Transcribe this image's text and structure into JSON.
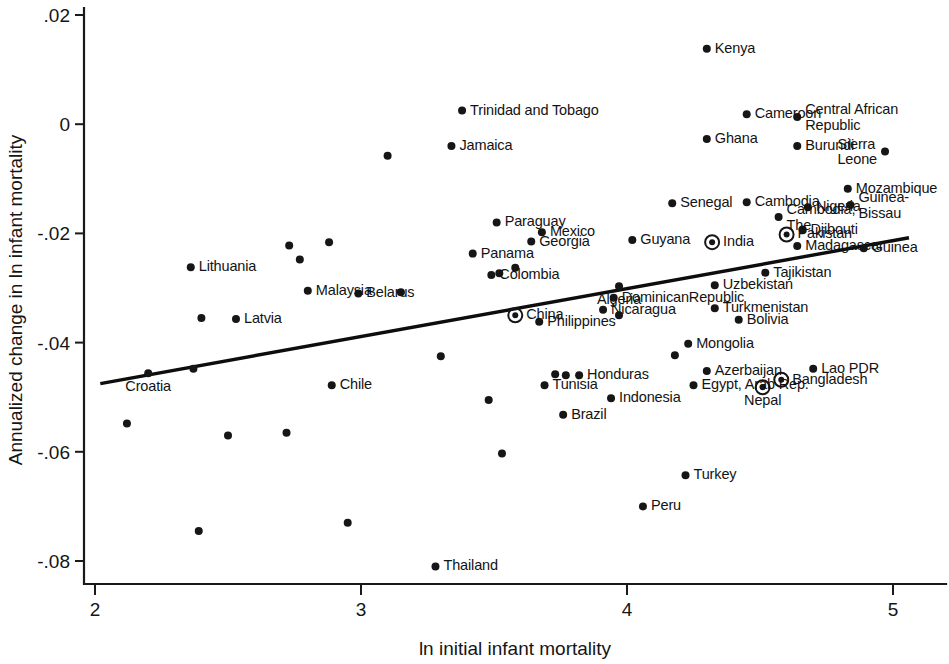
{
  "chart_data": {
    "type": "scatter",
    "title": "",
    "xlabel": "ln initial infant mortality",
    "ylabel": "Annualized change in ln infant mortality",
    "xlim": [
      1.95,
      5.1
    ],
    "ylim": [
      -0.0855,
      0.0225
    ],
    "grid": false,
    "legend": null,
    "xticks": [
      "2",
      "3",
      "4",
      "5"
    ],
    "xtickvals": [
      2,
      3,
      4,
      5
    ],
    "yticks": [
      ".02",
      "0",
      "-.02",
      "-.04",
      "-.06",
      "-.08"
    ],
    "ytickvals": [
      0.02,
      0,
      -0.02,
      -0.04,
      -0.06,
      -0.08
    ],
    "fit_line": {
      "x": [
        2.02,
        5.06
      ],
      "y": [
        -0.0475,
        -0.0208
      ]
    },
    "points": [
      {
        "label": "Kenya",
        "x": 4.3,
        "y": 0.0138,
        "side": "l",
        "highlight": false
      },
      {
        "label": "Trinidad and Tobago",
        "x": 3.38,
        "y": 0.0025,
        "side": "l",
        "highlight": false
      },
      {
        "label": "Cameroon",
        "x": 4.45,
        "y": 0.0018,
        "side": "l",
        "highlight": false
      },
      {
        "label": "Central African\nRepublic",
        "x": 4.64,
        "y": 0.0013,
        "side": "l",
        "highlight": false
      },
      {
        "label": "Ghana",
        "x": 4.3,
        "y": -0.0027,
        "side": "l",
        "highlight": false
      },
      {
        "label": "Burundi",
        "x": 4.64,
        "y": -0.004,
        "side": "l",
        "highlight": false
      },
      {
        "label": "Sierra\nLeone",
        "x": 4.97,
        "y": -0.005,
        "side": "r",
        "highlight": false
      },
      {
        "label": "Jamaica",
        "x": 3.34,
        "y": -0.004,
        "side": "l",
        "highlight": false
      },
      {
        "label": "",
        "x": 3.1,
        "y": -0.0058,
        "side": "l",
        "highlight": false
      },
      {
        "label": "Mozambique",
        "x": 4.83,
        "y": -0.0118,
        "side": "l",
        "highlight": false
      },
      {
        "label": "Senegal",
        "x": 4.17,
        "y": -0.0145,
        "side": "l",
        "highlight": false
      },
      {
        "label": "Cambodia",
        "x": 4.45,
        "y": -0.0143,
        "side": "l",
        "highlight": false
      },
      {
        "label": "Nigeria",
        "x": 4.68,
        "y": -0.0152,
        "side": "l",
        "highlight": false
      },
      {
        "label": "Guinea-\nBissau",
        "x": 4.84,
        "y": -0.0148,
        "side": "l",
        "highlight": false
      },
      {
        "label": "Cambodia,\nThe",
        "x": 4.57,
        "y": -0.017,
        "side": "l",
        "highlight": false
      },
      {
        "label": "Djibouti",
        "x": 4.66,
        "y": -0.0193,
        "side": "l",
        "highlight": false
      },
      {
        "label": "Paraguay",
        "x": 3.51,
        "y": -0.018,
        "side": "l",
        "highlight": false
      },
      {
        "label": "Mexico",
        "x": 3.68,
        "y": -0.0198,
        "side": "l",
        "highlight": false
      },
      {
        "label": "Georgia",
        "x": 3.64,
        "y": -0.0215,
        "side": "l",
        "highlight": false
      },
      {
        "label": "Pakistan",
        "x": 4.6,
        "y": -0.0202,
        "side": "l",
        "highlight": true
      },
      {
        "label": "Guyana",
        "x": 4.02,
        "y": -0.0212,
        "side": "l",
        "highlight": false
      },
      {
        "label": "India",
        "x": 4.32,
        "y": -0.0216,
        "side": "l",
        "highlight": true
      },
      {
        "label": "Panama",
        "x": 3.42,
        "y": -0.0237,
        "side": "l",
        "highlight": false
      },
      {
        "label": "Madagascar",
        "x": 4.64,
        "y": -0.0223,
        "side": "l",
        "highlight": false
      },
      {
        "label": "Guinea",
        "x": 4.89,
        "y": -0.0227,
        "side": "l",
        "highlight": false
      },
      {
        "label": "Lithuania",
        "x": 2.36,
        "y": -0.0262,
        "side": "l",
        "highlight": false
      },
      {
        "label": "",
        "x": 2.73,
        "y": -0.0222,
        "side": "l",
        "highlight": false
      },
      {
        "label": "",
        "x": 2.88,
        "y": -0.0216,
        "side": "l",
        "highlight": false
      },
      {
        "label": "",
        "x": 2.77,
        "y": -0.0248,
        "side": "l",
        "highlight": false
      },
      {
        "label": "Colombia",
        "x": 3.49,
        "y": -0.0276,
        "side": "l",
        "highlight": false
      },
      {
        "label": "",
        "x": 3.52,
        "y": -0.0273,
        "side": "l",
        "highlight": false
      },
      {
        "label": "",
        "x": 3.58,
        "y": -0.0263,
        "side": "l",
        "highlight": false
      },
      {
        "label": "Tajikistan",
        "x": 4.52,
        "y": -0.0272,
        "side": "l",
        "highlight": false
      },
      {
        "label": "Malaysia",
        "x": 2.8,
        "y": -0.0305,
        "side": "l",
        "highlight": false
      },
      {
        "label": "Belarus",
        "x": 2.99,
        "y": -0.031,
        "side": "l",
        "highlight": false
      },
      {
        "label": "",
        "x": 3.15,
        "y": -0.0308,
        "side": "l",
        "highlight": false
      },
      {
        "label": "Algeria",
        "x": 3.97,
        "y": -0.0297,
        "side": "b",
        "highlight": false
      },
      {
        "label": "Uzbekistan",
        "x": 4.33,
        "y": -0.0295,
        "side": "l",
        "highlight": false
      },
      {
        "label": "DominicanRepublic",
        "x": 3.95,
        "y": -0.0318,
        "side": "l",
        "highlight": false
      },
      {
        "label": "Turkmenistan",
        "x": 4.33,
        "y": -0.0337,
        "side": "l",
        "highlight": false
      },
      {
        "label": "Latvia",
        "x": 2.53,
        "y": -0.0357,
        "side": "l",
        "highlight": false
      },
      {
        "label": "",
        "x": 2.4,
        "y": -0.0355,
        "side": "l",
        "highlight": false
      },
      {
        "label": "China",
        "x": 3.58,
        "y": -0.035,
        "side": "l",
        "highlight": true
      },
      {
        "label": "Nicaragua",
        "x": 3.91,
        "y": -0.034,
        "side": "l",
        "highlight": false
      },
      {
        "label": "",
        "x": 3.97,
        "y": -0.035,
        "side": "l",
        "highlight": false
      },
      {
        "label": "Philippines",
        "x": 3.67,
        "y": -0.0362,
        "side": "l",
        "highlight": false
      },
      {
        "label": "Bolivia",
        "x": 4.42,
        "y": -0.0358,
        "side": "l",
        "highlight": false
      },
      {
        "label": "Croatia",
        "x": 2.2,
        "y": -0.0456,
        "side": "b",
        "highlight": false
      },
      {
        "label": "",
        "x": 2.37,
        "y": -0.0448,
        "side": "l",
        "highlight": false
      },
      {
        "label": "Mongolia",
        "x": 4.23,
        "y": -0.0402,
        "side": "l",
        "highlight": false
      },
      {
        "label": "",
        "x": 3.3,
        "y": -0.0425,
        "side": "l",
        "highlight": false
      },
      {
        "label": "",
        "x": 4.18,
        "y": -0.0423,
        "side": "l",
        "highlight": false
      },
      {
        "label": "Chile",
        "x": 2.89,
        "y": -0.0478,
        "side": "l",
        "highlight": false
      },
      {
        "label": "Honduras",
        "x": 3.82,
        "y": -0.046,
        "side": "l",
        "highlight": false
      },
      {
        "label": "",
        "x": 3.73,
        "y": -0.0458,
        "side": "l",
        "highlight": false
      },
      {
        "label": "",
        "x": 3.77,
        "y": -0.046,
        "side": "l",
        "highlight": false
      },
      {
        "label": "Azerbaijan",
        "x": 4.3,
        "y": -0.0452,
        "side": "l",
        "highlight": false
      },
      {
        "label": "Lao PDR",
        "x": 4.7,
        "y": -0.0448,
        "side": "l",
        "highlight": false
      },
      {
        "label": "Tunisia",
        "x": 3.69,
        "y": -0.0478,
        "side": "l",
        "highlight": false
      },
      {
        "label": "Egypt, Arab Rep.",
        "x": 4.25,
        "y": -0.0478,
        "side": "l",
        "highlight": false
      },
      {
        "label": "Bangladesh",
        "x": 4.58,
        "y": -0.0468,
        "side": "l",
        "highlight": true
      },
      {
        "label": "Nepal",
        "x": 4.51,
        "y": -0.0482,
        "side": "b",
        "highlight": true
      },
      {
        "label": "",
        "x": 3.48,
        "y": -0.0505,
        "side": "l",
        "highlight": false
      },
      {
        "label": "Indonesia",
        "x": 3.94,
        "y": -0.0502,
        "side": "l",
        "highlight": false
      },
      {
        "label": "Brazil",
        "x": 3.76,
        "y": -0.0532,
        "side": "l",
        "highlight": false
      },
      {
        "label": "",
        "x": 2.12,
        "y": -0.0548,
        "side": "l",
        "highlight": false
      },
      {
        "label": "",
        "x": 2.5,
        "y": -0.057,
        "side": "l",
        "highlight": false
      },
      {
        "label": "",
        "x": 2.72,
        "y": -0.0565,
        "side": "l",
        "highlight": false
      },
      {
        "label": "",
        "x": 3.53,
        "y": -0.0603,
        "side": "l",
        "highlight": false
      },
      {
        "label": "Turkey",
        "x": 4.22,
        "y": -0.0643,
        "side": "l",
        "highlight": false
      },
      {
        "label": "Peru",
        "x": 4.06,
        "y": -0.07,
        "side": "l",
        "highlight": false
      },
      {
        "label": "",
        "x": 2.39,
        "y": -0.0745,
        "side": "l",
        "highlight": false
      },
      {
        "label": "",
        "x": 2.95,
        "y": -0.073,
        "side": "l",
        "highlight": false
      },
      {
        "label": "Thailand",
        "x": 3.28,
        "y": -0.081,
        "side": "l",
        "highlight": false
      }
    ]
  }
}
